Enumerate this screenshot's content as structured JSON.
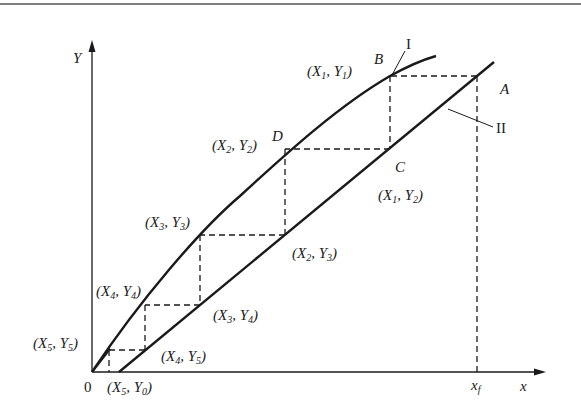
{
  "diagram": {
    "title": "",
    "axes": {
      "y_label": "Y",
      "x_label": "x",
      "origin_label": "0",
      "xf_label": {
        "main": "x",
        "sub": "f"
      }
    },
    "curves": [
      {
        "id": "I",
        "label": "I",
        "description": "equilibrium curve"
      },
      {
        "id": "II",
        "label": "II",
        "description": "operating line"
      }
    ],
    "points": {
      "A": "A",
      "B": "B",
      "C": "C",
      "D": "D"
    },
    "coordinate_labels": [
      {
        "id": "X1Y1",
        "X": "1",
        "Y": "1"
      },
      {
        "id": "X1Y2",
        "X": "1",
        "Y": "2"
      },
      {
        "id": "X2Y2",
        "X": "2",
        "Y": "2"
      },
      {
        "id": "X2Y3",
        "X": "2",
        "Y": "3"
      },
      {
        "id": "X3Y3",
        "X": "3",
        "Y": "3"
      },
      {
        "id": "X3Y4",
        "X": "3",
        "Y": "4"
      },
      {
        "id": "X4Y4",
        "X": "4",
        "Y": "4"
      },
      {
        "id": "X4Y5",
        "X": "4",
        "Y": "5"
      },
      {
        "id": "X5Y5",
        "X": "5",
        "Y": "5"
      },
      {
        "id": "X5Y0",
        "X": "5",
        "Y": "0"
      }
    ],
    "colors": {
      "line": "#1a1a1a",
      "background": "#ffffff",
      "rule": "#555555"
    }
  }
}
